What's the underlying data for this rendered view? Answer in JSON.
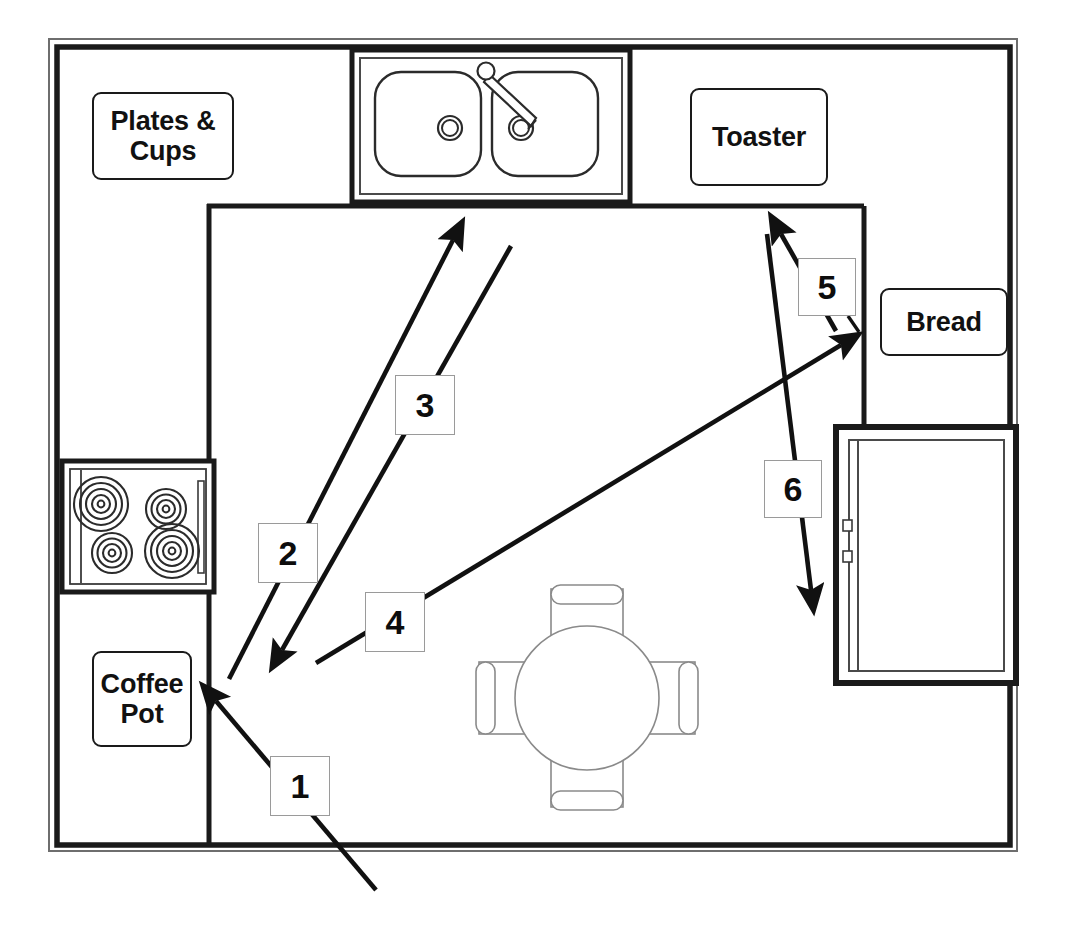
{
  "diagram": {
    "type": "floor-plan"
  },
  "room": {
    "wall_color": "#1a1a1a",
    "fill_color": "#ffffff"
  },
  "item_labels": [
    {
      "id": "plates-cups",
      "text": "Plates &\nCups",
      "x": 92,
      "y": 92,
      "w": 142,
      "h": 88
    },
    {
      "id": "toaster",
      "text": "Toaster",
      "x": 690,
      "y": 88,
      "w": 138,
      "h": 98
    },
    {
      "id": "bread",
      "text": "Bread",
      "x": 880,
      "y": 288,
      "w": 128,
      "h": 68
    },
    {
      "id": "coffee-pot",
      "text": "Coffee\nPot",
      "x": 92,
      "y": 651,
      "w": 100,
      "h": 96
    }
  ],
  "step_boxes": [
    {
      "id": "step-1",
      "number": "1",
      "x": 270,
      "y": 756,
      "size": 60
    },
    {
      "id": "step-2",
      "number": "2",
      "x": 258,
      "y": 523,
      "size": 60
    },
    {
      "id": "step-3",
      "number": "3",
      "x": 395,
      "y": 375,
      "size": 60
    },
    {
      "id": "step-4",
      "number": "4",
      "x": 365,
      "y": 592,
      "size": 60
    },
    {
      "id": "step-5",
      "number": "5",
      "x": 798,
      "y": 258,
      "size": 58
    },
    {
      "id": "step-6",
      "number": "6",
      "x": 764,
      "y": 460,
      "size": 58
    }
  ],
  "appliances": [
    {
      "id": "sink",
      "name": "double-basin-sink",
      "x": 352,
      "y": 50,
      "w": 278,
      "h": 148
    },
    {
      "id": "stove",
      "name": "stove-cooktop",
      "x": 62,
      "y": 460,
      "w": 152,
      "h": 130
    },
    {
      "id": "refrigerator",
      "name": "refrigerator",
      "x": 836,
      "y": 426,
      "w": 180,
      "h": 258
    },
    {
      "id": "table",
      "name": "round-dining-table",
      "cx": 588,
      "cy": 698,
      "r": 72
    }
  ],
  "arrows": [
    {
      "id": "arrow-1",
      "label": "1",
      "direction": "up-left",
      "from": [
        375,
        888
      ],
      "to": [
        215,
        700
      ]
    },
    {
      "id": "arrow-2",
      "label": "2",
      "direction": "up-right",
      "from": [
        228,
        678
      ],
      "to": [
        455,
        238
      ]
    },
    {
      "id": "arrow-3",
      "label": "3",
      "direction": "down-left",
      "from": [
        510,
        245
      ],
      "to": [
        281,
        652
      ]
    },
    {
      "id": "arrow-4",
      "label": "4",
      "direction": "up-right",
      "from": [
        315,
        663
      ],
      "to": [
        843,
        344
      ]
    },
    {
      "id": "arrow-5",
      "label": "5",
      "direction": "up-left",
      "from": [
        838,
        330
      ],
      "to": [
        780,
        232
      ]
    },
    {
      "id": "arrow-6",
      "label": "6",
      "direction": "down",
      "from": [
        768,
        233
      ],
      "to": [
        812,
        592
      ]
    }
  ],
  "stove_burners": [
    {
      "id": "burner-back-left",
      "cx": 101,
      "cy": 503,
      "r": 27,
      "size": "large"
    },
    {
      "id": "burner-back-right",
      "cx": 165,
      "cy": 508,
      "r": 19,
      "size": "small"
    },
    {
      "id": "burner-front-left",
      "cx": 112,
      "cy": 553,
      "r": 19,
      "size": "small"
    },
    {
      "id": "burner-front-right",
      "cx": 172,
      "cy": 551,
      "r": 27,
      "size": "large"
    }
  ],
  "sink_basins": [
    {
      "id": "basin-left",
      "x": 376,
      "y": 73,
      "w": 104,
      "h": 103
    },
    {
      "id": "basin-right",
      "x": 493,
      "y": 73,
      "w": 104,
      "h": 103
    }
  ],
  "chairs": [
    {
      "id": "chair-north",
      "position": "north"
    },
    {
      "id": "chair-south",
      "position": "south"
    },
    {
      "id": "chair-west",
      "position": "west"
    },
    {
      "id": "chair-east",
      "position": "east"
    }
  ]
}
